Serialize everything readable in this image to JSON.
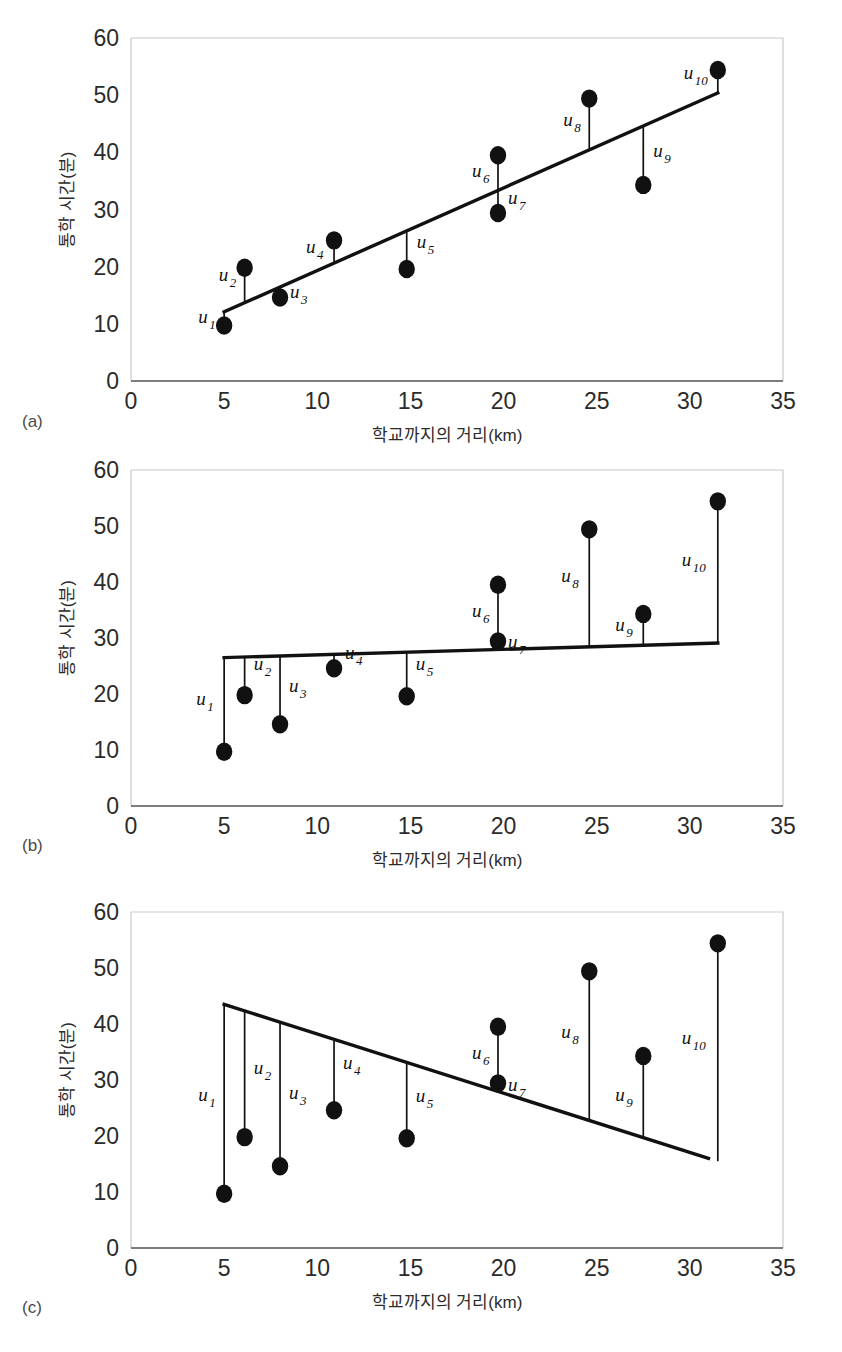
{
  "figure": {
    "panels": [
      {
        "letter": "(a)",
        "name": "panel-a"
      },
      {
        "letter": "(b)",
        "name": "panel-b"
      },
      {
        "letter": "(c)",
        "name": "panel-c"
      }
    ]
  },
  "axes": {
    "xlabel": "학교까지의 거리(km)",
    "ylabel": "통학 시간(분)",
    "xticks": [
      "0",
      "5",
      "10",
      "15",
      "20",
      "25",
      "30",
      "35"
    ],
    "yticks": [
      "0",
      "10",
      "20",
      "30",
      "40",
      "50",
      "60"
    ],
    "xlim": [
      0,
      35
    ],
    "ylim": [
      0,
      60
    ]
  },
  "residual_labels": [
    "u1",
    "u2",
    "u3",
    "u4",
    "u5",
    "u6",
    "u7",
    "u8",
    "u9",
    "u10"
  ],
  "residual_label_base": "u",
  "residual_label_subs": [
    "1",
    "2",
    "3",
    "4",
    "5",
    "6",
    "7",
    "8",
    "9",
    "10"
  ],
  "colors": {
    "dot": "#111111",
    "fit_line": "#111111",
    "residual_line": "#111111",
    "axis": "#7d7d7d",
    "frame": "#c9c9c9",
    "text": "#2b2b2b"
  },
  "chart_data": [
    {
      "id": "a",
      "type": "scatter",
      "title": "",
      "xlabel": "학교까지의 거리(km)",
      "ylabel": "통학 시간(분)",
      "xlim": [
        0,
        35
      ],
      "ylim": [
        0,
        60
      ],
      "xticks": [
        0,
        5,
        10,
        15,
        20,
        25,
        30,
        35
      ],
      "yticks": [
        0,
        10,
        20,
        30,
        40,
        50,
        60
      ],
      "grid": false,
      "legend": "none",
      "x": [
        5.0,
        6.1,
        8.0,
        10.9,
        14.8,
        19.7,
        19.7,
        24.6,
        27.5,
        31.5
      ],
      "y": [
        9.7,
        19.8,
        14.6,
        24.6,
        19.6,
        39.5,
        29.4,
        49.4,
        34.3,
        54.4
      ],
      "point_labels": [
        "u1",
        "u2",
        "u3",
        "u4",
        "u5",
        "u6",
        "u7",
        "u8",
        "u9",
        "u10"
      ],
      "fit_line": {
        "x": [
          5.0,
          31.5
        ],
        "y": [
          12.1,
          50.4
        ],
        "label": "least-squares fit"
      },
      "residual_segments": [
        {
          "label": "u1",
          "x": 5.0,
          "y_point": 9.7,
          "y_line": 12.1
        },
        {
          "label": "u2",
          "x": 6.1,
          "y_point": 19.8,
          "y_line": 13.7
        },
        {
          "label": "u3",
          "x": 8.0,
          "y_point": 14.6,
          "y_line": 16.4
        },
        {
          "label": "u4",
          "x": 10.9,
          "y_point": 24.6,
          "y_line": 20.6
        },
        {
          "label": "u5",
          "x": 14.8,
          "y_point": 19.6,
          "y_line": 26.2
        },
        {
          "label": "u6",
          "x": 19.7,
          "y_point": 39.5,
          "y_line": 33.3
        },
        {
          "label": "u7",
          "x": 19.7,
          "y_point": 29.4,
          "y_line": 33.3
        },
        {
          "label": "u8",
          "x": 24.6,
          "y_point": 49.4,
          "y_line": 40.4
        },
        {
          "label": "u9",
          "x": 27.5,
          "y_point": 34.3,
          "y_line": 44.6
        },
        {
          "label": "u10",
          "x": 31.5,
          "y_point": 54.4,
          "y_line": 50.4
        }
      ]
    },
    {
      "id": "b",
      "type": "scatter",
      "title": "",
      "xlabel": "학교까지의 거리(km)",
      "ylabel": "통학 시간(분)",
      "xlim": [
        0,
        35
      ],
      "ylim": [
        0,
        60
      ],
      "xticks": [
        0,
        5,
        10,
        15,
        20,
        25,
        30,
        35
      ],
      "yticks": [
        0,
        10,
        20,
        30,
        40,
        50,
        60
      ],
      "grid": false,
      "legend": "none",
      "x": [
        5.0,
        6.1,
        8.0,
        10.9,
        14.8,
        19.7,
        19.7,
        24.6,
        27.5,
        31.5
      ],
      "y": [
        9.7,
        19.8,
        14.6,
        24.6,
        19.6,
        39.5,
        29.4,
        49.4,
        34.3,
        54.4
      ],
      "point_labels": [
        "u1",
        "u2",
        "u3",
        "u4",
        "u5",
        "u6",
        "u7",
        "u8",
        "u9",
        "u10"
      ],
      "fit_line": {
        "x": [
          5.0,
          31.5
        ],
        "y": [
          26.5,
          29.1
        ],
        "label": "flat comparison line"
      },
      "residual_segments": [
        {
          "label": "u1",
          "x": 5.0,
          "y_point": 9.7,
          "y_line": 26.5
        },
        {
          "label": "u2",
          "x": 6.1,
          "y_point": 19.8,
          "y_line": 26.6
        },
        {
          "label": "u3",
          "x": 8.0,
          "y_point": 14.6,
          "y_line": 26.8
        },
        {
          "label": "u4",
          "x": 10.9,
          "y_point": 24.6,
          "y_line": 27.1
        },
        {
          "label": "u5",
          "x": 14.8,
          "y_point": 19.6,
          "y_line": 27.5
        },
        {
          "label": "u6",
          "x": 19.7,
          "y_point": 39.5,
          "y_line": 28.0
        },
        {
          "label": "u7",
          "x": 19.7,
          "y_point": 29.4,
          "y_line": 28.0
        },
        {
          "label": "u8",
          "x": 24.6,
          "y_point": 49.4,
          "y_line": 28.5
        },
        {
          "label": "u9",
          "x": 27.5,
          "y_point": 34.3,
          "y_line": 28.8
        },
        {
          "label": "u10",
          "x": 31.5,
          "y_point": 54.4,
          "y_line": 29.1
        }
      ]
    },
    {
      "id": "c",
      "type": "scatter",
      "title": "",
      "xlabel": "학교까지의 거리(km)",
      "ylabel": "통학 시간(분)",
      "xlim": [
        0,
        35
      ],
      "ylim": [
        0,
        60
      ],
      "xticks": [
        0,
        5,
        10,
        15,
        20,
        25,
        30,
        35
      ],
      "yticks": [
        0,
        10,
        20,
        30,
        40,
        50,
        60
      ],
      "grid": false,
      "legend": "none",
      "x": [
        5.0,
        6.1,
        8.0,
        10.9,
        14.8,
        19.7,
        19.7,
        24.6,
        27.5,
        31.5
      ],
      "y": [
        9.7,
        19.8,
        14.6,
        24.6,
        19.6,
        39.5,
        29.4,
        49.4,
        34.3,
        54.4
      ],
      "point_labels": [
        "u1",
        "u2",
        "u3",
        "u4",
        "u5",
        "u6",
        "u7",
        "u8",
        "u9",
        "u10"
      ],
      "fit_line": {
        "x": [
          5.0,
          31.0
        ],
        "y": [
          43.5,
          16.0
        ],
        "label": "negative-slope comparison line"
      },
      "residual_segments": [
        {
          "label": "u1",
          "x": 5.0,
          "y_point": 9.7,
          "y_line": 43.5
        },
        {
          "label": "u2",
          "x": 6.1,
          "y_point": 19.8,
          "y_line": 42.3
        },
        {
          "label": "u3",
          "x": 8.0,
          "y_point": 14.6,
          "y_line": 40.3
        },
        {
          "label": "u4",
          "x": 10.9,
          "y_point": 24.6,
          "y_line": 37.2
        },
        {
          "label": "u5",
          "x": 14.8,
          "y_point": 19.6,
          "y_line": 33.1
        },
        {
          "label": "u6",
          "x": 19.7,
          "y_point": 39.5,
          "y_line": 27.9
        },
        {
          "label": "u7",
          "x": 19.7,
          "y_point": 29.4,
          "y_line": 27.9
        },
        {
          "label": "u8",
          "x": 24.6,
          "y_point": 49.4,
          "y_line": 22.7
        },
        {
          "label": "u9",
          "x": 27.5,
          "y_point": 34.3,
          "y_line": 19.6
        },
        {
          "label": "u10",
          "x": 31.5,
          "y_point": 54.4,
          "y_line": 15.5
        }
      ]
    }
  ]
}
